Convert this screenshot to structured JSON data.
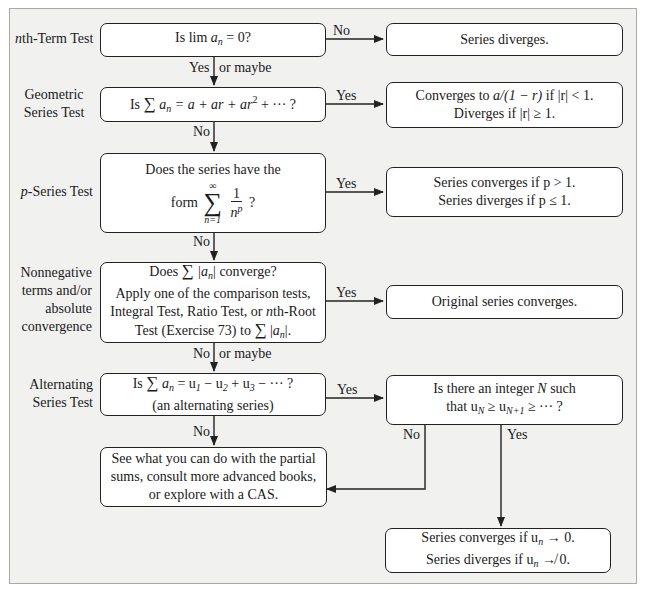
{
  "diagram": {
    "type": "flowchart",
    "topic": "Series convergence tests",
    "colors": {
      "panel_bg": "#f1f1f0",
      "box_bg": "#ffffff",
      "stroke": "#222222"
    }
  },
  "tests": [
    {
      "id": "nth-term",
      "label": "nth-Term Test",
      "label_italic_prefix": "n",
      "label_rest": "th-Term Test"
    },
    {
      "id": "geometric",
      "label_lines": [
        "Geometric",
        "Series Test"
      ]
    },
    {
      "id": "p-series",
      "label": "p-Series Test",
      "label_italic_prefix": "p",
      "label_rest": "-Series Test"
    },
    {
      "id": "nonnegative",
      "label_lines": [
        "Nonnegative",
        "terms and/or",
        "absolute",
        "convergence"
      ]
    },
    {
      "id": "alternating",
      "label_lines": [
        "Alternating",
        "Series Test"
      ]
    }
  ],
  "nodes": {
    "q1": {
      "prefix": "Is lim ",
      "var": "a",
      "sub": "n",
      "suffix": " = 0?"
    },
    "q2": {
      "prefix": "Is ",
      "sigma": "∑",
      "var": "a",
      "sub": "n",
      "suffix": " = a + ar + ar",
      "sup": "2",
      "tail": " + ··· ?"
    },
    "q3": {
      "line1": "Does the series have the",
      "form": "form",
      "sum_top": "∞",
      "sum_bottom": "n=1",
      "num": "1",
      "den": "n",
      "den_sup": "p",
      "tail": "?"
    },
    "q4": {
      "line1_prefix": "Does ",
      "line1_mid": "|a",
      "line1_sub": "n",
      "line1_suffix": "| converge?",
      "line2": "Apply one of the comparison tests,",
      "line3": "Integral Test, Ratio Test, or nth-Root",
      "line3_pre": "Integral Test, Ratio Test, or ",
      "line3_n": "n",
      "line3_post": "th-Root",
      "line4_prefix": "Test (Exercise 73) to ",
      "line4_suffix": "."
    },
    "q5": {
      "line1_prefix": "Is ",
      "line1_eq": " = u",
      "line1_tail": " − u",
      "line1_tail2": " + u",
      "line1_end": " − ··· ?",
      "line2": "(an alternating series)"
    },
    "r1": {
      "text": "Series diverges."
    },
    "r2": {
      "line1_pre": "Converges to ",
      "line1_expr": "a/(1 − r)",
      "line1_post": " if |r| < 1.",
      "line2": "Diverges if |r| ≥ 1."
    },
    "r3": {
      "line1": "Series converges if p > 1.",
      "line2": "Series diverges if p ≤ 1."
    },
    "r4": {
      "text": "Original series converges."
    },
    "r5": {
      "line1_pre": "Is there an integer ",
      "line1_N": "N",
      "line1_post": " such",
      "line2_pre": "that u",
      "line2_mid": " ≥ u",
      "line2_post": " ≥ ··· ?"
    },
    "r6": {
      "line1": "See what you can do with the partial",
      "line2": "sums, consult more advanced books,",
      "line3": "or explore with a CAS."
    },
    "r7": {
      "line1_pre": "Series converges if u",
      "line1_post": " → 0.",
      "line2_pre": "Series diverges if u",
      "line2_post": " ↛ 0."
    }
  },
  "edges": {
    "q1_no": "No",
    "q1_yes": "Yes",
    "q1_maybe": "or maybe",
    "q2_yes": "Yes",
    "q2_no": "No",
    "q3_yes": "Yes",
    "q3_no": "No",
    "q4_yes": "Yes",
    "q4_no": "No",
    "q4_maybe": "or maybe",
    "q5_yes": "Yes",
    "q5_no": "No",
    "r5_no": "No",
    "r5_yes": "Yes"
  }
}
